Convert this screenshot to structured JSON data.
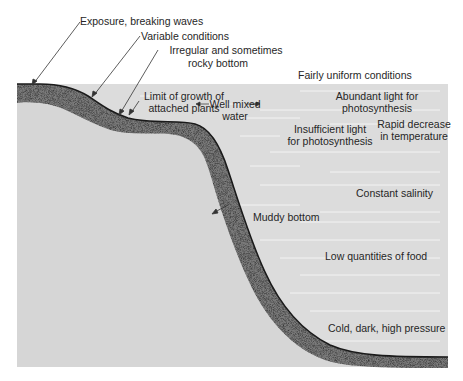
{
  "diagram": {
    "type": "ocean-shelf-cross-section",
    "colors": {
      "water": "#dcdcdc",
      "land": "#d6d6d6",
      "sediment": "#7a7a7a",
      "seafloor_line": "#1a1a1a",
      "text": "#262626",
      "water_streaks": "#f2f2f2"
    },
    "labels": {
      "exposure": "Exposure, breaking waves",
      "variable": "Variable conditions",
      "irregular_1": "Irregular and sometimes",
      "irregular_2": "rocky bottom",
      "uniform": "Fairly uniform conditions",
      "limit_1": "Limit of growth of",
      "limit_2": "attached plants",
      "well_mixed_1": "Well mixed",
      "well_mixed_2": "water",
      "abundant_1": "Abundant light for",
      "abundant_2": "photosynthesis",
      "insufficient_1": "Insufficient light",
      "insufficient_2": "for photosynthesis",
      "rapid_1": "Rapid decrease",
      "rapid_2": "in temperature",
      "salinity": "Constant salinity",
      "muddy": "Muddy bottom",
      "food": "Low quantities of food",
      "cold": "Cold, dark, high pressure"
    }
  }
}
